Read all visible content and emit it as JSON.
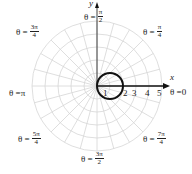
{
  "diagram": {
    "type": "polar_graph",
    "origin_px": [
      97,
      86
    ],
    "unit_px": 13,
    "rings": 5,
    "spoke_count": 24,
    "colors": {
      "grid": "#d6d6d6",
      "curve": "#111111",
      "axis": "#111111"
    },
    "axes": {
      "x_label": "x",
      "y_label": "y"
    },
    "radial_ticks": [
      "1",
      "2",
      "3",
      "4",
      "5"
    ],
    "angle_labels": [
      {
        "id": "0",
        "prefix": "θ = ",
        "value": "0"
      },
      {
        "id": "pi4",
        "prefix": "θ = ",
        "num": "π",
        "den": "4"
      },
      {
        "id": "pi2",
        "prefix": "θ = ",
        "num": "π",
        "den": "2"
      },
      {
        "id": "3pi4",
        "prefix": "θ = ",
        "num": "3π",
        "den": "4"
      },
      {
        "id": "pi",
        "prefix": "θ = ",
        "value": "π"
      },
      {
        "id": "5pi4",
        "prefix": "θ = ",
        "num": "5π",
        "den": "4"
      },
      {
        "id": "3pi2",
        "prefix": "θ = ",
        "num": "3π",
        "den": "2"
      },
      {
        "id": "7pi4",
        "prefix": "θ = ",
        "num": "7π",
        "den": "4"
      }
    ],
    "curve": {
      "equation": "r = 2cos θ",
      "shape": "circle",
      "center_r": 1,
      "radius": 1
    }
  }
}
